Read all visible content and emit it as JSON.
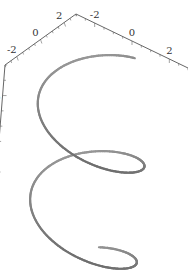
{
  "chart_data": {
    "type": "line",
    "subtype": "3d-parametric-curve",
    "title": "",
    "xlabel": "",
    "ylabel": "",
    "zlabel": "",
    "x_axis": {
      "range": [
        -3,
        3
      ],
      "ticks": [
        -2,
        0,
        2
      ],
      "tick_labels": [
        "-2",
        "0",
        "2"
      ]
    },
    "y_axis": {
      "range": [
        -3,
        3
      ],
      "ticks": [
        -2,
        0,
        2
      ],
      "tick_labels": [
        "-2",
        "0",
        "2"
      ]
    },
    "z_axis": {
      "range": [
        -7,
        7
      ],
      "ticks": [
        -5,
        0,
        5
      ],
      "tick_labels": [
        "-5",
        "0",
        "5"
      ]
    },
    "series": [
      {
        "name": "helix",
        "parametric": {
          "radius": 2.5,
          "t_range": [
            -6.5,
            6.5
          ]
        },
        "color": "#808080"
      }
    ],
    "grid": false,
    "legend": "none"
  }
}
